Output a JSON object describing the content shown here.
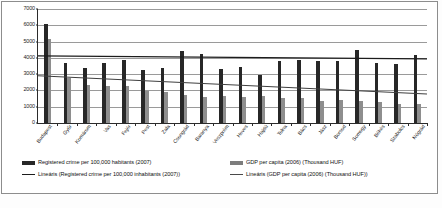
{
  "chart_data": {
    "type": "bar",
    "title": "",
    "xlabel": "",
    "ylabel": "",
    "ylim": [
      0,
      7000
    ],
    "ytick_step": 1000,
    "yticks": [
      "0",
      "1000",
      "2000",
      "3000",
      "4000",
      "5000",
      "6000",
      "7000"
    ],
    "grid": true,
    "legend_position": "bottom",
    "categories": [
      "Budapest",
      "Győr",
      "Komárom",
      "Vas",
      "Fejér",
      "Pest",
      "Zala",
      "Csongrád",
      "Baranya",
      "Veszprém",
      "Heves",
      "Hajdú",
      "Tolna",
      "Bács",
      "Jász",
      "Borsod",
      "Somogy",
      "Békés",
      "Szabolcs",
      "Nógrád"
    ],
    "series": [
      {
        "name": "Registered crime per 100,000 habitants (2007)",
        "color": "#272727",
        "values": [
          6050,
          3700,
          3400,
          3670,
          3870,
          3270,
          3400,
          4400,
          4230,
          3330,
          3420,
          2950,
          3780,
          3850,
          3780,
          3820,
          4490,
          3680,
          3620,
          4150
        ]
      },
      {
        "name": "GDP per capita (2006) (Thousand HUF)",
        "color": "#8e8e8e",
        "values": [
          5150,
          2760,
          2360,
          2250,
          2250,
          1970,
          1880,
          1730,
          1600,
          1680,
          1580,
          1640,
          1530,
          1560,
          1380,
          1420,
          1360,
          1260,
          1180,
          1140
        ]
      }
    ],
    "trendlines": [
      {
        "name": "Lineáris (Registered crime per 100,000 inhabitants (2007))",
        "color": "#1c1c1c",
        "start_value": 4120,
        "end_value": 3940
      },
      {
        "name": "Lineáris (GDP per capita (2006) (Thousand HUF))",
        "color": "#3f3f3f",
        "start_value": 2900,
        "end_value": 1780
      }
    ]
  },
  "legend": {
    "items": [
      {
        "key": "crime-bar",
        "label": "Registered crime per 100,000 habitants (2007)"
      },
      {
        "key": "gdp-bar",
        "label": "GDP per capita (2006) (Thousand HUF)"
      },
      {
        "key": "crime-line",
        "label": "Lineáris (Registered crime per 100,000 inhabitants (2007))"
      },
      {
        "key": "gdp-line",
        "label": "Lineáris (GDP per capita (2006) (Thousand HUF))"
      }
    ]
  },
  "caption": {
    "text": ""
  }
}
